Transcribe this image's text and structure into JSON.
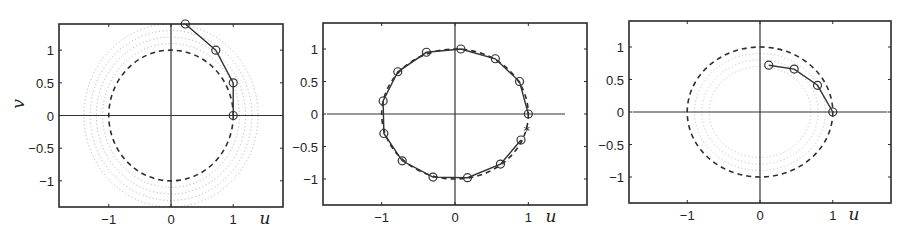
{
  "chart_data": [
    {
      "type": "line",
      "panel": "left",
      "title": "",
      "xlabel": "u",
      "ylabel": "v",
      "xlim": [
        -1.8,
        1.8
      ],
      "ylim": [
        -1.4,
        1.4
      ],
      "xticks": [
        -1,
        0,
        1
      ],
      "xtick_labels": [
        "−1",
        "0",
        "1"
      ],
      "yticks": [
        1,
        0.5,
        0,
        -0.5,
        -1
      ],
      "ytick_labels": [
        "1",
        "0.5",
        "0",
        "−0.5",
        "−1"
      ],
      "show_ytick_labels": true,
      "show_ylabel": true,
      "grid": false,
      "axes_lines": {
        "u_extent": [
          -1.8,
          1.8
        ]
      },
      "reference_circle": {
        "style": "dashed",
        "radius": 1.0
      },
      "dotted_circles": {
        "style": "dotted",
        "color": "#b8b8b8",
        "radii": [
          1.1,
          1.2,
          1.3,
          1.4
        ]
      },
      "series": [
        {
          "name": "trajectory",
          "marker": "circle",
          "points": [
            [
              1.0,
              0.0
            ],
            [
              1.0,
              0.5
            ],
            [
              0.72,
              1.0
            ],
            [
              0.23,
              1.4
            ]
          ]
        }
      ],
      "star_marker": null
    },
    {
      "type": "line",
      "panel": "middle",
      "title": "",
      "xlabel": "u",
      "ylabel": "",
      "xlim": [
        -1.8,
        1.8
      ],
      "ylim": [
        -1.4,
        1.4
      ],
      "xticks": [
        -1,
        0,
        1
      ],
      "xtick_labels": [
        "−1",
        "0",
        "1"
      ],
      "yticks": [
        1,
        0.5,
        0,
        -0.5,
        -1
      ],
      "ytick_labels": [
        "1",
        "0.5",
        "0",
        "−0.5",
        "−1"
      ],
      "show_ytick_labels": true,
      "show_ylabel": false,
      "grid": false,
      "axes_lines": {
        "u_extent": [
          -1.75,
          1.5
        ]
      },
      "reference_circle": {
        "style": "dashed",
        "radius": 1.0
      },
      "dotted_circles": null,
      "series": [
        {
          "name": "trajectory",
          "marker": "circle",
          "points": [
            [
              1.0,
              0.0
            ],
            [
              0.88,
              0.5
            ],
            [
              0.55,
              0.85
            ],
            [
              0.08,
              1.0
            ],
            [
              -0.39,
              0.95
            ],
            [
              -0.78,
              0.65
            ],
            [
              -0.98,
              0.2
            ],
            [
              -0.97,
              -0.3
            ],
            [
              -0.72,
              -0.72
            ],
            [
              -0.3,
              -0.97
            ],
            [
              0.17,
              -0.98
            ],
            [
              0.62,
              -0.77
            ],
            [
              0.9,
              -0.4
            ]
          ]
        }
      ],
      "star_marker": [
        0.98,
        -0.25
      ]
    },
    {
      "type": "line",
      "panel": "right",
      "title": "",
      "xlabel": "u",
      "ylabel": "",
      "xlim": [
        -1.8,
        1.8
      ],
      "ylim": [
        -1.4,
        1.4
      ],
      "xticks": [
        -1,
        0,
        1
      ],
      "xtick_labels": [
        "−1",
        "0",
        "1"
      ],
      "yticks": [
        1,
        0.5,
        0,
        -0.5,
        -1
      ],
      "ytick_labels": [
        "1",
        "0.5",
        "0",
        "−0.5",
        "−1"
      ],
      "show_ytick_labels": true,
      "show_ylabel": false,
      "grid": false,
      "axes_lines": {
        "u_extent": [
          -1.75,
          1.75
        ]
      },
      "reference_circle": {
        "style": "dashed",
        "radius": 1.0
      },
      "dotted_circles": {
        "style": "dotted",
        "color": "#c4c4c4",
        "radii": [
          0.9,
          0.8,
          0.7
        ]
      },
      "series": [
        {
          "name": "trajectory",
          "marker": "circle",
          "points": [
            [
              1.0,
              0.0
            ],
            [
              0.79,
              0.41
            ],
            [
              0.47,
              0.66
            ],
            [
              0.12,
              0.72
            ]
          ]
        }
      ],
      "star_marker": null
    }
  ],
  "layout": {
    "panels": [
      {
        "left": 59,
        "top": 24,
        "right": 283,
        "bottom": 207,
        "ulabel_x": 265,
        "ulabel_y": 224,
        "vlabel_x": 24,
        "vlabel_y": 104
      },
      {
        "left": 323,
        "top": 23,
        "right": 587,
        "bottom": 205,
        "ulabel_x": 551,
        "ulabel_y": 222
      },
      {
        "left": 629,
        "top": 21,
        "right": 891,
        "bottom": 203,
        "ulabel_x": 854,
        "ulabel_y": 220
      }
    ],
    "colors": {
      "frame": "#2a2a2a",
      "line": "#333333",
      "dashed": "#2e2e2e"
    }
  }
}
